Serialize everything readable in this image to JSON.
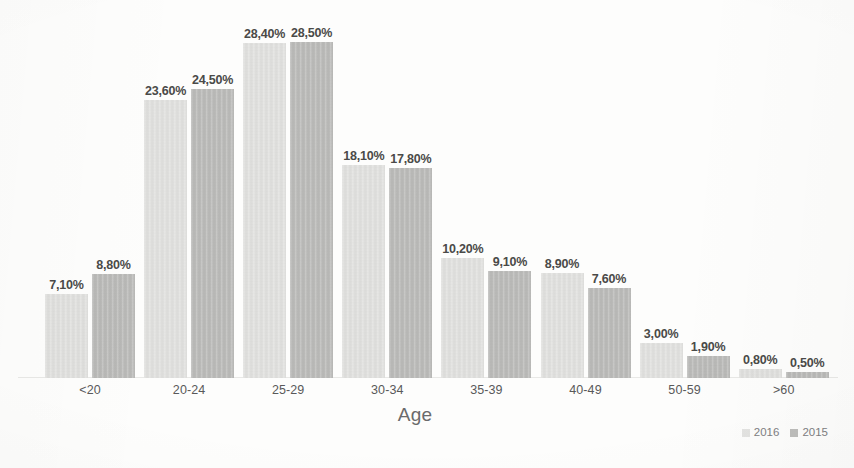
{
  "chart_data": {
    "type": "bar",
    "title": "",
    "xlabel": "Age",
    "ylabel": "",
    "categories": [
      "<20",
      "20-24",
      "25-29",
      "30-34",
      "35-39",
      "40-49",
      "50-59",
      ">60"
    ],
    "series": [
      {
        "name": "2016",
        "color": "#e3e3e1",
        "values": [
          7.1,
          23.6,
          28.4,
          18.1,
          10.2,
          8.9,
          3.0,
          0.8
        ],
        "labels": [
          "7,10%",
          "23,60%",
          "28,40%",
          "18,10%",
          "10,20%",
          "8,90%",
          "3,00%",
          "0,80%"
        ]
      },
      {
        "name": "2015",
        "color": "#bdbdbb",
        "values": [
          8.8,
          24.5,
          28.5,
          17.8,
          9.1,
          7.6,
          1.9,
          0.5
        ],
        "labels": [
          "8,80%",
          "24,50%",
          "28,50%",
          "17,80%",
          "9,10%",
          "7,60%",
          "1,90%",
          "0,50%"
        ]
      }
    ],
    "ylim": [
      0,
      28.5
    ],
    "grid": false,
    "axis_visible": true,
    "legend_position": "bottom-right",
    "data_labels_shown": true,
    "decimal_separator": ","
  },
  "legend": {
    "items": [
      {
        "label": "2016",
        "color": "#e3e3e1"
      },
      {
        "label": "2015",
        "color": "#bdbdbb"
      }
    ]
  },
  "axis": {
    "x_title": "Age"
  }
}
